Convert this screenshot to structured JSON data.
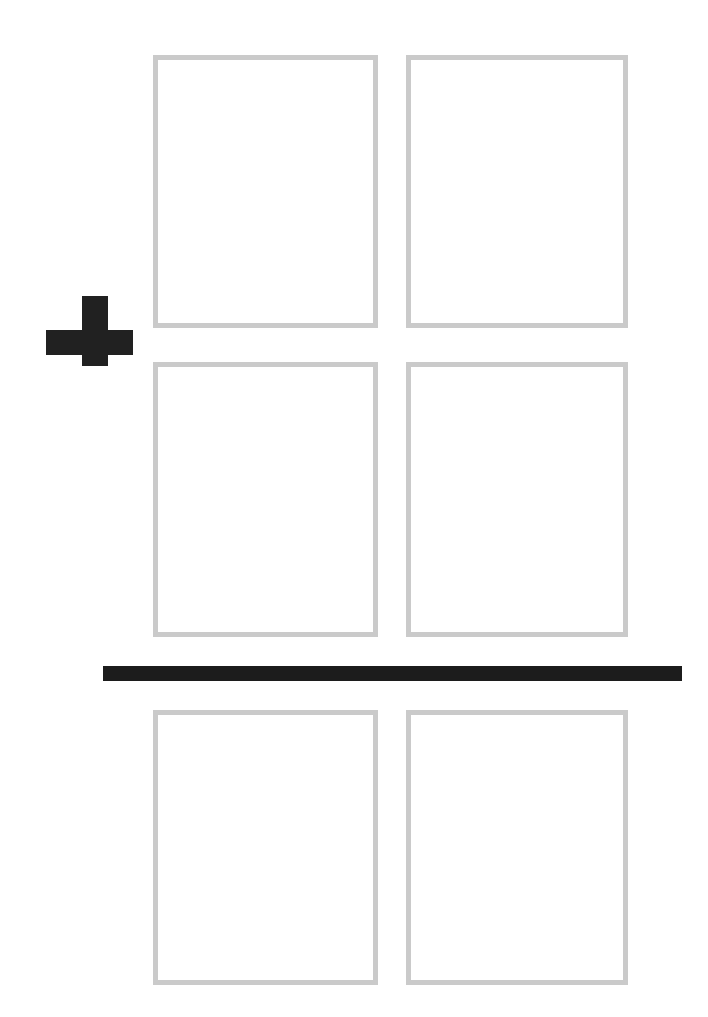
{
  "page": {
    "width": 708,
    "height": 1017,
    "background_color": "#ffffff"
  },
  "style": {
    "box_border_color": "#cacaca",
    "box_border_width": 5,
    "box_fill_color": "#ffffff",
    "operator_color": "#212121",
    "rule_color": "#1c1c1c"
  },
  "operator": {
    "symbol": "+",
    "name": "plus-sign",
    "label": "plus",
    "x": 46,
    "y": 296,
    "width": 87,
    "height": 70
  },
  "rule": {
    "name": "sum-line",
    "label": "sum bar",
    "x": 103,
    "y": 666,
    "width": 579,
    "height": 15
  },
  "columns": [
    {
      "name": "tens",
      "label": "tens column",
      "x": 153,
      "width": 225
    },
    {
      "name": "ones",
      "label": "ones column",
      "x": 406,
      "width": 222
    }
  ],
  "rows": [
    {
      "name": "first-addend",
      "label": "First addend",
      "role": "addend",
      "y": 55,
      "height": 273,
      "cells": [
        {
          "name": "first-addend-tens",
          "value": "",
          "placeholder": ""
        },
        {
          "name": "first-addend-ones",
          "value": "",
          "placeholder": ""
        }
      ]
    },
    {
      "name": "second-addend",
      "label": "Second addend",
      "role": "addend",
      "y": 362,
      "height": 275,
      "cells": [
        {
          "name": "second-addend-tens",
          "value": "",
          "placeholder": ""
        },
        {
          "name": "second-addend-ones",
          "value": "",
          "placeholder": ""
        }
      ]
    },
    {
      "name": "sum",
      "label": "Sum",
      "role": "result",
      "y": 710,
      "height": 275,
      "cells": [
        {
          "name": "sum-tens",
          "value": "",
          "placeholder": ""
        },
        {
          "name": "sum-ones",
          "value": "",
          "placeholder": ""
        }
      ]
    }
  ]
}
